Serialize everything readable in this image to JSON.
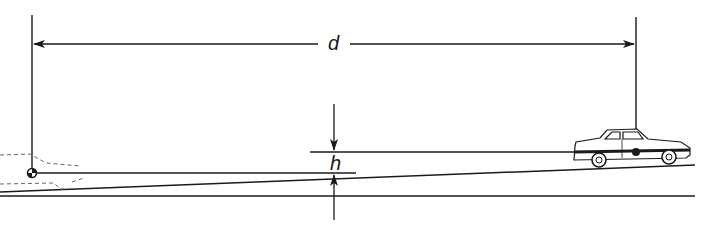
{
  "diagram": {
    "title": "",
    "labels": {
      "distance": "d",
      "height": "h"
    },
    "elements": [
      {
        "name": "observer-eye-marker",
        "kind": "center-of-mass symbol",
        "position": "left"
      },
      {
        "name": "target-car",
        "kind": "car illustration",
        "position": "right, on inclined road"
      },
      {
        "name": "ghost-car",
        "kind": "dashed car outline",
        "position": "left, partially cropped"
      },
      {
        "name": "inclined-road",
        "kind": "sloped line"
      },
      {
        "name": "level-ground",
        "kind": "horizontal line"
      }
    ],
    "colors": {
      "line": "#1a1a1a",
      "dashed": "#555555",
      "background": "#ffffff"
    }
  }
}
